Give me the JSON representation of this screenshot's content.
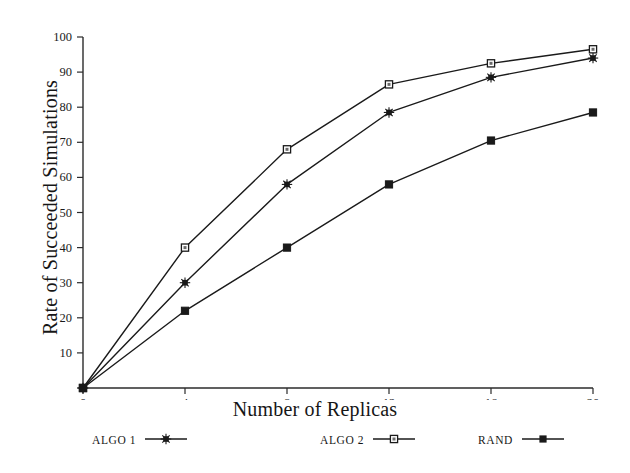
{
  "chart_data": {
    "type": "line",
    "title": "",
    "xlabel": "Number of Replicas",
    "ylabel": "Rate of Succeeded Simulations",
    "x": [
      0,
      4,
      8,
      12,
      16,
      20
    ],
    "xticks": [
      "0",
      "4",
      "8",
      "12",
      "16",
      "20"
    ],
    "yticks": [
      "0",
      "10",
      "20",
      "30",
      "40",
      "50",
      "60",
      "70",
      "80",
      "90",
      "100"
    ],
    "xlim": [
      0,
      20
    ],
    "ylim": [
      0,
      100
    ],
    "grid": false,
    "legend_position": "below-axes",
    "series": [
      {
        "name": "ALGO 1",
        "marker": "star",
        "color": "#1a1a1a",
        "values": [
          0,
          30,
          58,
          78.5,
          88.5,
          94
        ]
      },
      {
        "name": "ALGO 2",
        "marker": "open-square",
        "color": "#1a1a1a",
        "values": [
          0,
          40,
          68,
          86.5,
          92.5,
          96.5
        ]
      },
      {
        "name": "RAND",
        "marker": "filled-square",
        "color": "#1a1a1a",
        "values": [
          0,
          22,
          40,
          58,
          70.5,
          78.5
        ]
      }
    ]
  },
  "legend": {
    "items": [
      {
        "label": "ALGO 1",
        "marker": "star"
      },
      {
        "label": "ALGO 2",
        "marker": "open-square"
      },
      {
        "label": "RAND",
        "marker": "filled-square"
      }
    ]
  },
  "colors": {
    "ink": "#1a1a1a",
    "axis": "#2b2b2b",
    "background": "#ffffff"
  }
}
